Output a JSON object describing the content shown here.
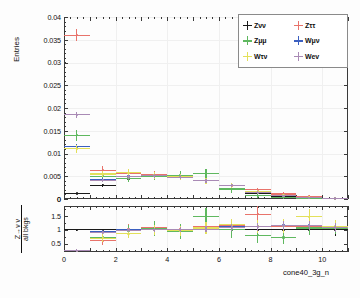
{
  "figure": {
    "title": "",
    "xaxis_title": "cone40_3g_n",
    "main_ylabel": "Entries",
    "ratio_ylabel_numerator": "Z→ν ν",
    "ratio_ylabel_denominator": "all bkgs"
  },
  "legend": {
    "items": [
      {
        "label": "Zνν",
        "color": "#1a1a1a",
        "key": "Znunu"
      },
      {
        "label": "Zττ",
        "color": "#e8736b",
        "key": "Ztautau"
      },
      {
        "label": "Zμμ",
        "color": "#5fb85f",
        "key": "Zmumu"
      },
      {
        "label": "Wμν",
        "color": "#3b5fc0",
        "key": "Wmunu"
      },
      {
        "label": "Wτν",
        "color": "#e3e05a",
        "key": "Wtaunu"
      },
      {
        "label": "Wev",
        "color": "#a98ab5",
        "key": "Wenu"
      }
    ]
  },
  "chart_data": {
    "type": "line",
    "title": "",
    "xlabel": "cone40_3g_n",
    "ylabel": "Entries",
    "xlim": [
      0,
      11
    ],
    "ylim": [
      0,
      0.04
    ],
    "grid": true,
    "legend_position": "top-right",
    "xticks": [
      0,
      2,
      4,
      6,
      8,
      10
    ],
    "xticklabels": [
      "0",
      "2",
      "4",
      "6",
      "8",
      "10"
    ],
    "yticks": [
      0,
      0.005,
      0.01,
      0.015,
      0.02,
      0.025,
      0.03,
      0.035,
      0.04
    ],
    "yticklabels": [
      "0",
      "0.005",
      "0.01",
      "0.015",
      "0.02",
      "0.025",
      "0.03",
      "0.035",
      "0.04"
    ],
    "bin_centers": [
      0.5,
      1.5,
      2.5,
      3.5,
      4.5,
      5.5,
      6.5,
      7.5,
      8.5,
      9.5,
      10.5
    ],
    "bin_halfwidth": 0.5,
    "series": [
      {
        "name": "Zνν",
        "color": "#1a1a1a",
        "values": [
          0.0012,
          0.003,
          0.0045,
          0.0052,
          0.0048,
          0.004,
          0.003,
          0.0013,
          0.0006,
          0.0003,
          0.0001
        ],
        "errors": [
          0.0002,
          0.0004,
          0.0005,
          0.0005,
          0.0005,
          0.0005,
          0.0004,
          0.0003,
          0.0002,
          0.0001,
          0.0001
        ]
      },
      {
        "name": "Zττ",
        "color": "#e8736b",
        "values": [
          0.036,
          0.0063,
          0.0057,
          0.0053,
          0.005,
          0.004,
          0.0029,
          0.002,
          0.0011,
          0.0006,
          0.0002
        ],
        "errors": [
          0.0013,
          0.0009,
          0.0008,
          0.0008,
          0.0008,
          0.0007,
          0.0006,
          0.0005,
          0.0004,
          0.0003,
          0.0002
        ]
      },
      {
        "name": "Zμμ",
        "color": "#5fb85f",
        "values": [
          0.014,
          0.005,
          0.0046,
          0.005,
          0.0052,
          0.0056,
          0.0022,
          0.0007,
          0.0004,
          0.0002,
          0.0001
        ],
        "errors": [
          0.0012,
          0.0008,
          0.0008,
          0.0009,
          0.0009,
          0.001,
          0.0008,
          0.0005,
          0.0003,
          0.0002,
          0.0001
        ]
      },
      {
        "name": "Wμν",
        "color": "#3b5fc0",
        "values": [
          0.0115,
          0.0042,
          0.005,
          0.0052,
          0.0049,
          0.0041,
          0.003,
          0.0015,
          0.0008,
          0.0004,
          0.0001
        ],
        "errors": [
          0.0006,
          0.0004,
          0.0004,
          0.0004,
          0.0004,
          0.0004,
          0.0003,
          0.0003,
          0.0002,
          0.0001,
          0.0001
        ]
      },
      {
        "name": "Wτν",
        "color": "#e3e05a",
        "values": [
          0.011,
          0.0055,
          0.0058,
          0.0052,
          0.0049,
          0.004,
          0.003,
          0.0016,
          0.0008,
          0.0004,
          0.0001
        ],
        "errors": [
          0.0009,
          0.0007,
          0.0007,
          0.0007,
          0.0007,
          0.0006,
          0.0005,
          0.0004,
          0.0003,
          0.0002,
          0.0001
        ]
      },
      {
        "name": "Wev",
        "color": "#a98ab5",
        "values": [
          0.0185,
          0.0041,
          0.0049,
          0.0051,
          0.0048,
          0.004,
          0.003,
          0.0014,
          0.0007,
          0.0003,
          0.0001
        ],
        "errors": [
          0.0006,
          0.0004,
          0.0004,
          0.0004,
          0.0004,
          0.0004,
          0.0003,
          0.0003,
          0.0002,
          0.0001,
          0.0001
        ]
      }
    ]
  },
  "ratio_data": {
    "type": "line",
    "ylabel": "Z→ν ν / all bkgs",
    "xlim": [
      0,
      11
    ],
    "ylim": [
      0.2,
      1.85
    ],
    "yticks": [
      0.5,
      1,
      1.5
    ],
    "yticklabels": [
      "0.5",
      "1",
      "1.5"
    ],
    "bin_centers": [
      0.5,
      1.5,
      2.5,
      3.5,
      4.5,
      5.5,
      6.5,
      7.5,
      8.5,
      9.5,
      10.5
    ],
    "bin_halfwidth": 0.5,
    "series": [
      {
        "name": "Zνν",
        "color": "#1a1a1a",
        "values": [
          1.0,
          1.0,
          1.0,
          1.0,
          1.0,
          1.0,
          1.0,
          1.0,
          1.0,
          1.0,
          1.0
        ],
        "errors": [
          0.03,
          0.04,
          0.05,
          0.06,
          0.06,
          0.09,
          0.1,
          0.13,
          0.16,
          0.19,
          0.22
        ]
      },
      {
        "name": "Zττ",
        "color": "#e8736b",
        "values": [
          0.25,
          0.6,
          1.02,
          1.06,
          1.02,
          1.1,
          1.14,
          1.56,
          1.12,
          1.12,
          1.1
        ],
        "errors": [
          0.06,
          0.16,
          0.2,
          0.2,
          0.2,
          0.22,
          0.22,
          0.28,
          0.26,
          0.26,
          0.22
        ]
      },
      {
        "name": "Zμμ",
        "color": "#5fb85f",
        "values": [
          0.25,
          0.72,
          0.96,
          1.04,
          0.94,
          1.48,
          1.0,
          0.8,
          0.72,
          1.06,
          1.05
        ],
        "errors": [
          0.06,
          0.16,
          0.22,
          0.26,
          0.28,
          0.3,
          0.28,
          0.26,
          0.24,
          0.24,
          0.22
        ]
      },
      {
        "name": "Wμν",
        "color": "#3b5fc0",
        "values": [
          0.25,
          0.92,
          1.0,
          1.0,
          1.0,
          1.02,
          1.1,
          1.12,
          1.16,
          1.16,
          1.1
        ],
        "errors": [
          0.04,
          0.06,
          0.07,
          0.07,
          0.08,
          0.1,
          0.12,
          0.14,
          0.16,
          0.16,
          0.16
        ]
      },
      {
        "name": "Wτν",
        "color": "#e3e05a",
        "values": [
          0.25,
          0.7,
          0.86,
          1.0,
          0.96,
          1.06,
          1.18,
          1.12,
          1.14,
          1.46,
          1.12
        ],
        "errors": [
          0.06,
          0.14,
          0.16,
          0.18,
          0.18,
          0.2,
          0.22,
          0.24,
          0.26,
          0.28,
          0.22
        ]
      },
      {
        "name": "Wev",
        "color": "#a98ab5",
        "values": [
          0.25,
          0.9,
          0.98,
          1.0,
          1.0,
          1.02,
          1.08,
          1.1,
          1.14,
          1.14,
          1.08
        ],
        "errors": [
          0.04,
          0.06,
          0.07,
          0.07,
          0.08,
          0.1,
          0.12,
          0.14,
          0.16,
          0.16,
          0.16
        ]
      }
    ]
  }
}
